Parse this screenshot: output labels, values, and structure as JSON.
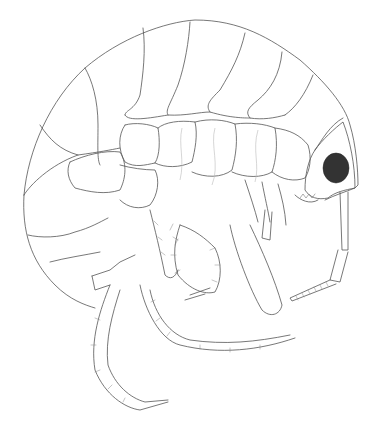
{
  "figure": {
    "style": "black-and-white line drawing",
    "background": "#ffffff",
    "line_color": "#555555",
    "eye_color": "#333333"
  },
  "parts": {
    "body_segments": 8,
    "eye": "eye",
    "antennae": [
      "antenna-1",
      "antenna-2"
    ],
    "legs": [
      "gnathopod-1",
      "gnathopod-2",
      "pereopod-front",
      "pereopod-rear"
    ]
  }
}
